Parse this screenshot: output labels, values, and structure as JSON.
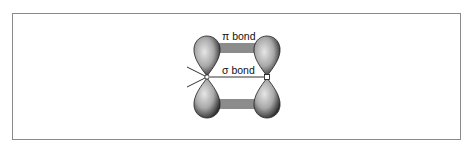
{
  "diagram": {
    "labels": {
      "pi_bond": "π bond",
      "sigma_bond": "σ bond"
    },
    "colors": {
      "border": "#8a8a8a",
      "orbital_dark": "#2a2a2a",
      "orbital_light": "#d8d8d8",
      "pi_overlap_bar": "#8c8c8c",
      "line": "#333333"
    }
  }
}
